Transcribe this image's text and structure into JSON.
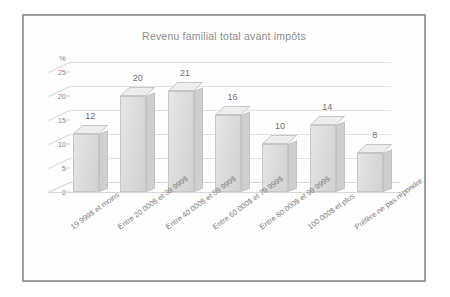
{
  "chart_data": {
    "type": "bar",
    "title": "Revenu familial total avant impôts",
    "xlabel": "",
    "ylabel": "%",
    "ylim": [
      0,
      27
    ],
    "grid": true,
    "legend": "none",
    "yticks": [
      "0",
      "5",
      "10",
      "15",
      "20",
      "25"
    ],
    "categories": [
      "19 999$ et moins",
      "Entre 20 000$ et 39 999$",
      "Entre 40 000$ et 59 999$",
      "Entre 60 000$ et 79 999$",
      "Entre 80 000$ et 99 999$",
      "100 000$ et plus",
      "Préfère ne pas répondre"
    ],
    "values": [
      12,
      20,
      21,
      16,
      10,
      14,
      8
    ],
    "value_labels": [
      "12",
      "20",
      "21",
      "16",
      "10",
      "14",
      "8"
    ]
  },
  "colors": {
    "frame": "#9c9c9c",
    "bar_front": "#dcdcdc",
    "bar_side": "#cfcfcf",
    "bar_top": "#ededed",
    "grid": "#e2e2e2",
    "text": "#8a8a8a",
    "title_text": "#8d8d8d",
    "background": "#ffffff"
  }
}
